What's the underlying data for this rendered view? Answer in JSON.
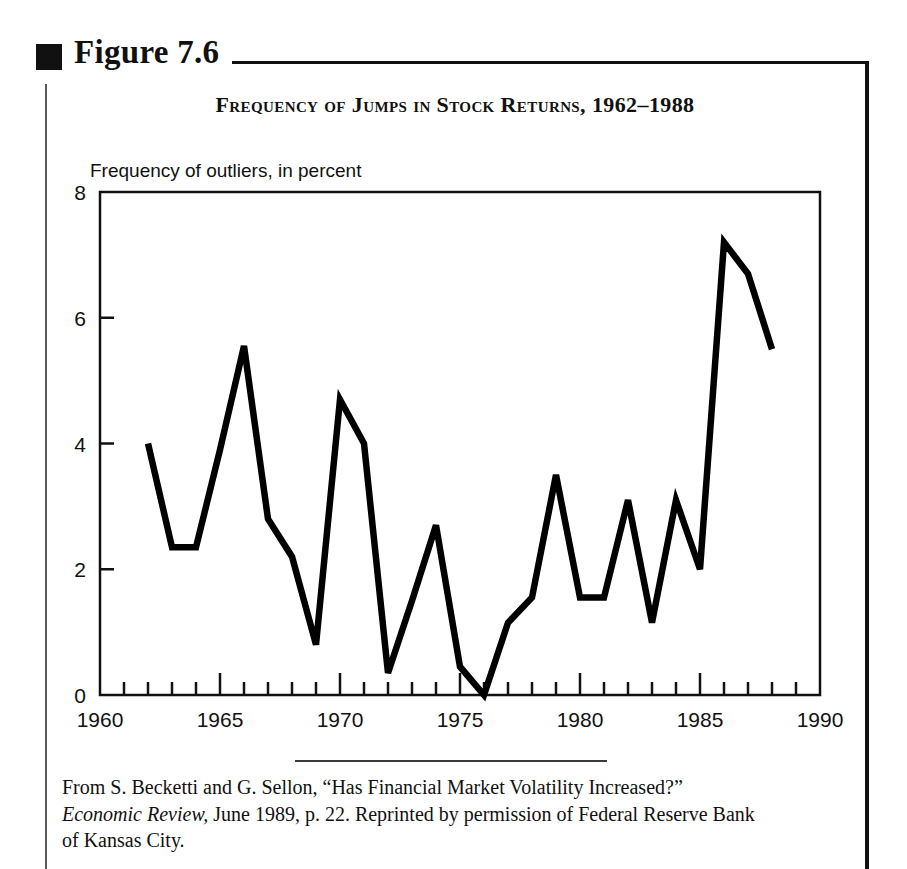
{
  "figure": {
    "bullet_icon": "filled-square-icon",
    "label": "Figure 7.6"
  },
  "chart_title": "Frequency of Jumps in Stock Returns, 1962–1988",
  "source_caption": {
    "part1": "From S. Becketti and G. Sellon, “Has Financial Market Volatility Increased?” ",
    "italic": "Economic Review,",
    "part2": " June 1989, p. 22. Reprinted by permission of Federal Reserve Bank of Kansas City."
  },
  "colors": {
    "ink": "#111111",
    "line": "#000000",
    "rule": "#3a3a3a"
  },
  "chart_data": {
    "type": "line",
    "title": "Frequency of Jumps in Stock Returns, 1962–1988",
    "xlabel": "",
    "ylabel": "Frequency of outliers, in percent",
    "xlim": [
      1960,
      1990
    ],
    "ylim": [
      0,
      8
    ],
    "grid": false,
    "legend": "none",
    "x_major_ticks": [
      1960,
      1965,
      1970,
      1975,
      1980,
      1985,
      1990
    ],
    "x_major_tick_labels": [
      "1960",
      "1965",
      "1970",
      "1975",
      "1980",
      "1985",
      "1990"
    ],
    "x_minor_tick_step": 1,
    "y_ticks": [
      0,
      2,
      4,
      6,
      8
    ],
    "y_tick_labels": [
      "0",
      "2",
      "4",
      "6",
      "8"
    ],
    "series": [
      {
        "name": "Frequency of outliers",
        "x": [
          1962,
          1963,
          1964,
          1965,
          1966,
          1967,
          1968,
          1969,
          1970,
          1971,
          1972,
          1973,
          1974,
          1975,
          1976,
          1977,
          1978,
          1979,
          1980,
          1981,
          1982,
          1983,
          1984,
          1985,
          1986,
          1987,
          1988
        ],
        "values": [
          4.0,
          2.35,
          2.35,
          3.9,
          5.55,
          2.8,
          2.2,
          0.8,
          4.7,
          4.0,
          0.35,
          1.5,
          2.7,
          0.45,
          0.0,
          1.15,
          1.55,
          3.5,
          1.55,
          1.55,
          3.1,
          1.15,
          3.1,
          2.0,
          7.2,
          6.7,
          5.5
        ]
      }
    ]
  }
}
